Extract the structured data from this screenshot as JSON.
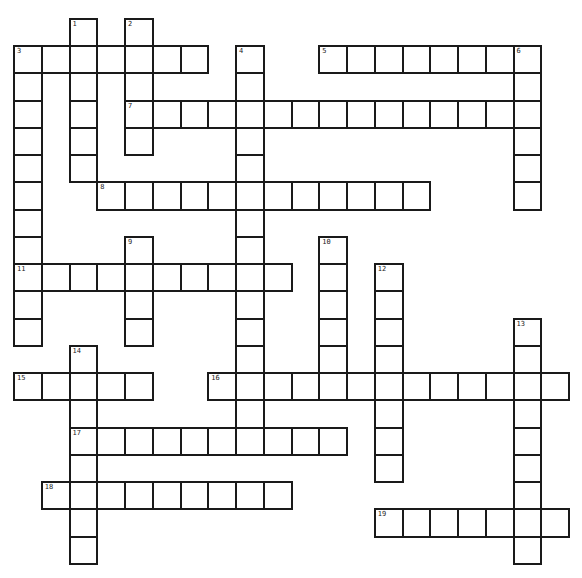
{
  "puzzle": {
    "title": "",
    "grid": {
      "origin_x": 13,
      "origin_y": 45,
      "cell_w": 27.75,
      "cell_h": 27.25
    },
    "colors": {
      "line": "#1a1a1a",
      "cell": "#ffffff",
      "background": "#ffffff"
    },
    "words": [
      {
        "num": "1",
        "dir": "down",
        "col": 2,
        "row": -1,
        "len": 6
      },
      {
        "num": "2",
        "dir": "down",
        "col": 4,
        "row": -1,
        "len": 5
      },
      {
        "num": "3",
        "dir": "across",
        "col": 0,
        "row": 0,
        "len": 7
      },
      {
        "num": "3",
        "dir": "down",
        "col": 0,
        "row": 0,
        "len": 11
      },
      {
        "num": "4",
        "dir": "down",
        "col": 8,
        "row": 0,
        "len": 15
      },
      {
        "num": "5",
        "dir": "across",
        "col": 11,
        "row": 0,
        "len": 8
      },
      {
        "num": "6",
        "dir": "down",
        "col": 18,
        "row": 0,
        "len": 6
      },
      {
        "num": "7",
        "dir": "across",
        "col": 4,
        "row": 2,
        "len": 15
      },
      {
        "num": "8",
        "dir": "across",
        "col": 3,
        "row": 5,
        "len": 12
      },
      {
        "num": "9",
        "dir": "down",
        "col": 4,
        "row": 7,
        "len": 4
      },
      {
        "num": "10",
        "dir": "down",
        "col": 11,
        "row": 7,
        "len": 6
      },
      {
        "num": "11",
        "dir": "across",
        "col": 0,
        "row": 8,
        "len": 10
      },
      {
        "num": "12",
        "dir": "down",
        "col": 13,
        "row": 8,
        "len": 8
      },
      {
        "num": "13",
        "dir": "down",
        "col": 18,
        "row": 10,
        "len": 9
      },
      {
        "num": "14",
        "dir": "down",
        "col": 2,
        "row": 11,
        "len": 8
      },
      {
        "num": "15",
        "dir": "across",
        "col": 0,
        "row": 12,
        "len": 5
      },
      {
        "num": "16",
        "dir": "across",
        "col": 7,
        "row": 12,
        "len": 13
      },
      {
        "num": "17",
        "dir": "across",
        "col": 2,
        "row": 14,
        "len": 10
      },
      {
        "num": "18",
        "dir": "across",
        "col": 1,
        "row": 16,
        "len": 9
      },
      {
        "num": "19",
        "dir": "across",
        "col": 13,
        "row": 17,
        "len": 7
      }
    ]
  }
}
